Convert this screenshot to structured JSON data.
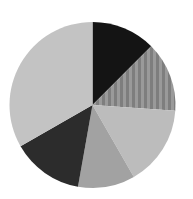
{
  "chart_data": {
    "type": "pie",
    "title": "",
    "start_angle_deg": 0,
    "direction": "clockwise",
    "labels": [
      "",
      "",
      "",
      "",
      "",
      ""
    ],
    "values": [
      12.5,
      13.6,
      15.6,
      11.1,
      13.9,
      33.3
    ],
    "colors": [
      "#141414",
      "#8c8c8c",
      "#bcbcbc",
      "#a2a2a2",
      "#2c2c2c",
      "#c3c3c3"
    ],
    "legend": "none",
    "center": [
      92.5,
      105
    ],
    "radius": 83
  }
}
